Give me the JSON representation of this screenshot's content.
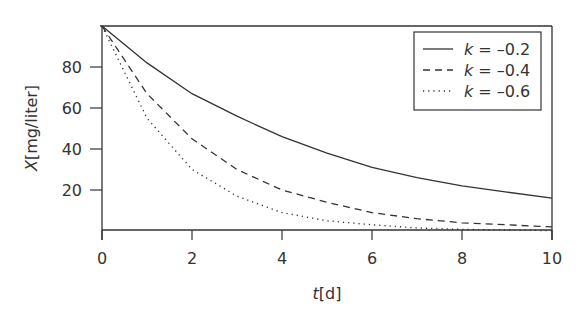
{
  "chart_data": {
    "type": "line",
    "title": "",
    "xlabel": "t[d]",
    "xlabel_var": "t",
    "xlabel_unit": "[d]",
    "ylabel": "X[mg/liter]",
    "ylabel_var": "X",
    "ylabel_unit": "[mg/liter]",
    "xlim": [
      0,
      10
    ],
    "ylim": [
      0,
      100
    ],
    "xticks": [
      0,
      2,
      4,
      6,
      8,
      10
    ],
    "yticks": [
      20,
      40,
      60,
      80
    ],
    "grid": false,
    "legend_position": "upper right",
    "x": [
      0,
      1,
      2,
      3,
      4,
      5,
      6,
      7,
      8,
      9,
      10
    ],
    "series": [
      {
        "name": "k = -0.2",
        "label_var": "k",
        "label_value": "= –0.2",
        "style": "solid",
        "values": [
          100,
          82,
          67,
          56,
          46,
          38,
          31,
          26,
          22,
          19,
          16
        ]
      },
      {
        "name": "k = -0.4",
        "label_var": "k",
        "label_value": "= –0.4",
        "style": "dashed",
        "values": [
          100,
          67,
          45,
          30,
          20,
          14,
          9,
          6,
          4,
          3,
          2
        ]
      },
      {
        "name": "k = -0.6",
        "label_var": "k",
        "label_value": "= –0.6",
        "style": "dotted",
        "values": [
          100,
          55,
          30,
          17,
          9,
          5,
          3,
          1.5,
          0.8,
          0.5,
          0.2
        ]
      }
    ]
  },
  "colors": {
    "line": "#333333",
    "axis": "#333333",
    "background": "#ffffff"
  }
}
